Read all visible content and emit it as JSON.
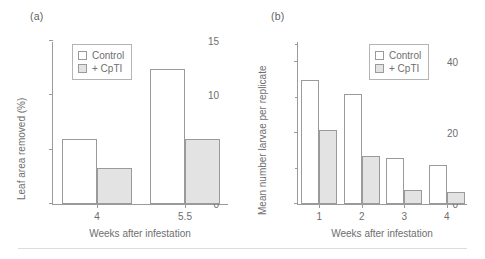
{
  "figure": {
    "background": "#ffffff",
    "axis_color": "#9a9a9a",
    "text_color": "#6e6e6e",
    "control_fill": "#ffffff",
    "cpti_fill": "#e3e3e3"
  },
  "panels": [
    {
      "label": "(a)"
    },
    {
      "label": "(b)"
    }
  ],
  "legend": {
    "control_label": "Control",
    "cpti_label": "+ CpTI"
  },
  "chart_data": [
    {
      "type": "bar",
      "panel": "(a)",
      "title": "",
      "xlabel": "Weeks after infestation",
      "ylabel": "Leaf area removed (%)",
      "categories": [
        "4",
        "5.5"
      ],
      "series": [
        {
          "name": "Control",
          "values": [
            6.0,
            12.4
          ]
        },
        {
          "name": "+ CpTI",
          "values": [
            3.3,
            6.0
          ]
        }
      ],
      "ylim": [
        0,
        15
      ],
      "yticks": [
        0,
        5,
        10,
        15
      ],
      "ytick_labels": [
        "0",
        "5",
        "10",
        "15"
      ],
      "yminor_ticks": [],
      "grid": false,
      "legend_position": "top-left"
    },
    {
      "type": "bar",
      "panel": "(b)",
      "title": "",
      "xlabel": "Weeks after infestation",
      "ylabel": "Mean number larvae per replicate",
      "categories": [
        "1",
        "2",
        "3",
        "4"
      ],
      "series": [
        {
          "name": "Control",
          "values": [
            35,
            31,
            13,
            11
          ]
        },
        {
          "name": "+ CpTI",
          "values": [
            21,
            13.5,
            4,
            3.5
          ]
        }
      ],
      "ylim": [
        0,
        46
      ],
      "yticks": [
        0,
        20,
        40
      ],
      "ytick_labels": [
        "0",
        "20",
        "40"
      ],
      "yminor_ticks": [
        10,
        30,
        45
      ],
      "grid": false,
      "legend_position": "top-right"
    }
  ]
}
